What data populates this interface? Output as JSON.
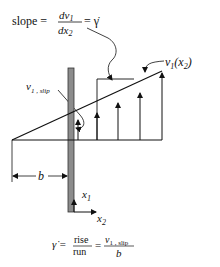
{
  "top_equation": {
    "lhs": "slope =",
    "num": "dv",
    "num_sub": "1",
    "den": "dx",
    "den_sub": "2",
    "rhs": "= γ̇"
  },
  "labels": {
    "profile": "v",
    "profile_sub": "1",
    "profile_arg": "(x",
    "profile_arg_sub": "2",
    "profile_close": ")",
    "slip": "v",
    "slip_sub": "1 , slip",
    "b": "b",
    "x1": "x",
    "x1_sub": "1",
    "x2": "x",
    "x2_sub": "2"
  },
  "bottom_equation": {
    "lhs": "γ̇ =",
    "frac1_num": "rise",
    "frac1_den": "run",
    "eq": "=",
    "frac2_num": "v",
    "frac2_num_sub": "1 , slip",
    "frac2_den": "b"
  },
  "colors": {
    "line": "#111111",
    "wall_fill": "#8c8c8c",
    "wall_stroke": "#333333"
  }
}
